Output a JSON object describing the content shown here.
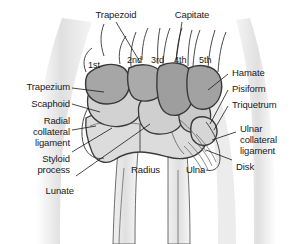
{
  "figure": {
    "colors": {
      "background": "#ffffff",
      "soft_tissue": "#e3e3e3",
      "distal_row_bone": "#a8a8a8",
      "proximal_row_bone": "#d2d2d2",
      "bone_outline": "#3a3a3a",
      "leader_line": "#1a1a1a",
      "text": "#1a1a1a"
    }
  },
  "labels": {
    "trapezoid": "Trapezoid",
    "capitate": "Capitate",
    "trapezium": "Trapezium",
    "scaphoid": "Scaphoid",
    "radial_collateral_ligament": "Radial\ncollateral\nligament",
    "radial_collateral_line1": "Radial",
    "radial_collateral_line2": "collateral",
    "radial_collateral_line3": "ligament",
    "styloid_process_line1": "Styloid",
    "styloid_process_line2": "process",
    "lunate": "Lunate",
    "radius": "Radius",
    "ulna": "Ulna",
    "hamate": "Hamate",
    "pisiform": "Pisiform",
    "triquetrum": "Triquetrum",
    "ulnar_collateral_line1": "Ulnar",
    "ulnar_collateral_line2": "collateral",
    "ulnar_collateral_line3": "ligament",
    "disk": "Disk"
  },
  "metacarpals": {
    "first": "1st",
    "second": "2nd",
    "third": "3rd",
    "fourth": "4th",
    "fifth": "5th"
  }
}
